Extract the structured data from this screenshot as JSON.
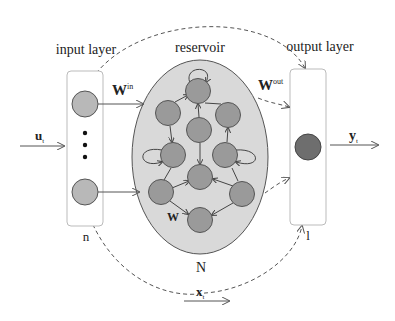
{
  "labels": {
    "input_layer": "input layer",
    "reservoir": "reservoir",
    "output_layer": "output layer",
    "w_in": "W",
    "w_in_sup": "in",
    "w_out": "W",
    "w_out_sup": "out",
    "w": "W",
    "u_t": "u",
    "u_t_sub": "t",
    "y_t": "y",
    "y_t_sub": "t",
    "x_t": "x",
    "x_t_sub": "t",
    "n": "n",
    "N": "N",
    "l": "l"
  },
  "colors": {
    "reservoir_fill": "#d9d9d9",
    "node_fill": "#9a9a9a",
    "input_node_fill": "#b8b8b8",
    "output_node_fill": "#6e6e6e",
    "stroke": "#555555"
  },
  "input_nodes": [
    {
      "x": 85,
      "y": 104
    },
    {
      "x": 85,
      "y": 192
    }
  ],
  "reservoir_nodes": [
    {
      "x": 198,
      "y": 91
    },
    {
      "x": 168,
      "y": 113
    },
    {
      "x": 228,
      "y": 115
    },
    {
      "x": 199,
      "y": 130
    },
    {
      "x": 173,
      "y": 155
    },
    {
      "x": 225,
      "y": 155
    },
    {
      "x": 200,
      "y": 177
    },
    {
      "x": 161,
      "y": 192
    },
    {
      "x": 242,
      "y": 194
    },
    {
      "x": 200,
      "y": 220
    }
  ],
  "output_nodes": [
    {
      "x": 308,
      "y": 147
    }
  ]
}
